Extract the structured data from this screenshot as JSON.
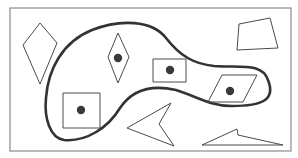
{
  "diagram": {
    "title": "",
    "colors": {
      "background": "#ffffff",
      "frame": "#8a8a8a",
      "blob_stroke": "#333333",
      "shape_stroke": "#4a4a4a",
      "dot_fill": "#3a3a3a"
    },
    "frame": {
      "x": 10,
      "y": 8,
      "width": 281,
      "height": 143
    },
    "region": {
      "name": "blob",
      "path": "M 64 140 C 50 138 44 118 46 98 C 48 70 62 42 92 30 C 120 19 152 20 166 38 C 180 56 194 64 214 66 C 240 68 262 62 268 80 C 276 100 262 106 232 106 C 210 106 196 96 176 90 C 150 84 132 90 120 108 C 108 128 86 142 64 140 Z"
    },
    "inside_shapes": [
      {
        "name": "diamond",
        "points": "118,33 129,57 118,83 108,57",
        "dot": {
          "cx": 118,
          "cy": 58,
          "r": 4.2
        }
      },
      {
        "name": "rectangle",
        "points": "153,59 186,59 186,82 153,82",
        "dot": {
          "cx": 170,
          "cy": 70,
          "r": 4.2
        }
      },
      {
        "name": "parallelogram",
        "points": "222,75 257,75 243,102 208,102",
        "dot": {
          "cx": 230,
          "cy": 91,
          "r": 4.2
        }
      },
      {
        "name": "square",
        "points": "63,93 100,93 100,128 63,128",
        "dot": {
          "cx": 81,
          "cy": 110,
          "r": 4.2
        }
      }
    ],
    "outside_shapes": [
      {
        "name": "kite",
        "points": "40,23 57,43 40,84 23,45"
      },
      {
        "name": "quadrilateral",
        "points": "239,24 270,18 278,48 237,50"
      },
      {
        "name": "arrowhead",
        "points": "171,103 159,124 174,146 127,128"
      },
      {
        "name": "wedge",
        "points": "202,145 237,129 238,135 283,145"
      }
    ]
  }
}
